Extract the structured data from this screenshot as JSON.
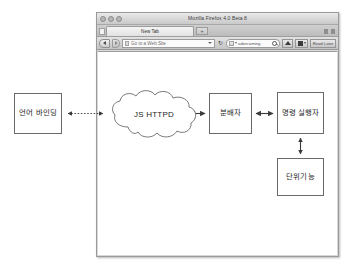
{
  "browser": {
    "window_title": "Mozilla Firefox 4.0 Beta 8",
    "traffic_lights": [
      "close",
      "minimize",
      "zoom"
    ],
    "tab": {
      "label": "New Tab",
      "new_tab_label": "+"
    },
    "toolbar": {
      "back_label": "Back",
      "forward_label": "Forward",
      "url_placeholder": "Go to a Web Site",
      "reload_label": "↻",
      "search_placeholder": "adorcaming",
      "home_label": "Home",
      "bookmarks_label": "Bookmarks",
      "readitlater_label": "Read Later"
    }
  },
  "diagram": {
    "nodes": [
      {
        "id": "language-binding",
        "label": "언어 바인딩",
        "shape": "rect"
      },
      {
        "id": "js-httpd",
        "label": "JS HTTPD",
        "shape": "cloud"
      },
      {
        "id": "dispatcher",
        "label": "분배자",
        "shape": "rect"
      },
      {
        "id": "command-executor",
        "label": "명령 실행자",
        "shape": "rect"
      },
      {
        "id": "unit-function",
        "label": "단위기능",
        "shape": "rect"
      }
    ],
    "edges": [
      {
        "from": "language-binding",
        "to": "js-httpd",
        "style": "dashed",
        "arrows": "both"
      },
      {
        "from": "js-httpd",
        "to": "dispatcher",
        "style": "solid",
        "arrows": "both"
      },
      {
        "from": "dispatcher",
        "to": "command-executor",
        "style": "solid",
        "arrows": "both"
      },
      {
        "from": "command-executor",
        "to": "unit-function",
        "style": "solid",
        "arrows": "both"
      }
    ],
    "colors": {
      "stroke": "#6a6a6a",
      "text": "#1d1d1d",
      "background": "#ffffff"
    }
  }
}
